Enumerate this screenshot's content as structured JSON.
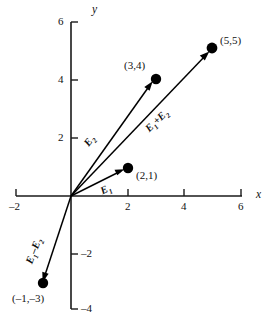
{
  "figure": {
    "background_color": "#ffffff",
    "ink_color": "#000000"
  },
  "chart_data": {
    "type": "scatter",
    "title": "",
    "xlabel": "x",
    "ylabel": "y",
    "xlim": [
      -2,
      6
    ],
    "ylim": [
      -4,
      6
    ],
    "xticks": [
      -2,
      2,
      4,
      6
    ],
    "yticks": [
      6,
      4,
      2,
      -2,
      -4
    ],
    "xtick_labels": [
      "–2",
      "2",
      "4",
      "6"
    ],
    "ytick_labels": [
      "6",
      "4",
      "2",
      "–2",
      "–4"
    ],
    "grid": false,
    "legend": "none",
    "points": [
      {
        "name": "point-2-1",
        "x": 2,
        "y": 1,
        "label": "(2,1)"
      },
      {
        "name": "point-3-4",
        "x": 3,
        "y": 4,
        "label": "(3,4)"
      },
      {
        "name": "point-5-5",
        "x": 5,
        "y": 5,
        "label": "(5,5)"
      },
      {
        "name": "point-neg1-neg3",
        "x": -1,
        "y": -3,
        "label": "(–1,–3)"
      }
    ],
    "vectors": [
      {
        "name": "vector-E1",
        "label": "E1",
        "label_html": "E<sub>1</sub>",
        "from": [
          0,
          0
        ],
        "to": [
          2,
          1
        ],
        "label_rotation_deg": -27
      },
      {
        "name": "vector-E2",
        "label": "E2",
        "label_html": "E<sub>2</sub>",
        "from": [
          0,
          0
        ],
        "to": [
          3,
          4
        ],
        "label_rotation_deg": -53
      },
      {
        "name": "vector-E1-plus-E2",
        "label": "E1+E2",
        "label_html": "E<sub>1</sub>+E<sub>2</sub>",
        "from": [
          0,
          0
        ],
        "to": [
          5,
          5
        ],
        "label_rotation_deg": -44
      },
      {
        "name": "vector-E1-minus-E2",
        "label": "E1-E2",
        "label_html": "E<sub>1</sub>–E<sub>2</sub>",
        "from": [
          0,
          0
        ],
        "to": [
          -1,
          -3
        ],
        "label_rotation_deg": -69
      }
    ]
  },
  "axes": {
    "x_axis_name": "x",
    "y_axis_name": "y"
  }
}
